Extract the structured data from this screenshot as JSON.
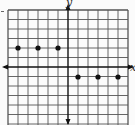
{
  "chart_data": {
    "type": "scatter",
    "title": "",
    "xlabel": "x",
    "ylabel": "y",
    "xlim": [
      -6,
      6
    ],
    "ylim": [
      -6,
      6
    ],
    "grid": true,
    "unit_px": 10,
    "origin_px": [
      68,
      67
    ],
    "series": [
      {
        "name": "points",
        "color": "#111111",
        "points": [
          {
            "x": -5,
            "y": 2
          },
          {
            "x": -3,
            "y": 2
          },
          {
            "x": -1,
            "y": 2
          },
          {
            "x": 1,
            "y": -1
          },
          {
            "x": 3,
            "y": -1
          },
          {
            "x": 5,
            "y": -1
          }
        ]
      }
    ]
  },
  "labels": {
    "x_axis": "x",
    "y_axis": "y"
  },
  "colors": {
    "grid": "#555555",
    "axis": "#111111",
    "background": "#fbfbfb"
  }
}
